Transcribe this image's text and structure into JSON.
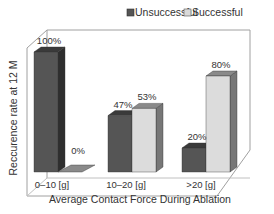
{
  "chart_data": {
    "type": "bar",
    "style": "3d-clustered",
    "title": "",
    "xlabel": "Average Contact Force During Ablation",
    "ylabel": "Reccurence rate at 12 M",
    "categories": [
      "0–10 [g]",
      "10–20 [g]",
      ">20 [g]"
    ],
    "series": [
      {
        "name": "Unsuccessful",
        "values": [
          100,
          47,
          20
        ],
        "labels": [
          "100%",
          "47%",
          "20%"
        ],
        "color": "#555555"
      },
      {
        "name": "Successful",
        "values": [
          0,
          53,
          80
        ],
        "labels": [
          "0%",
          "53%",
          "80%"
        ],
        "color": "#d9d9d9"
      }
    ],
    "ylim": [
      0,
      100
    ],
    "grid": false,
    "legend_position": "top",
    "value_unit": "%"
  },
  "legend": {
    "items": [
      {
        "label": "Unsuccessful",
        "color": "#555555"
      },
      {
        "label": "Successful",
        "color": "#d9d9d9"
      }
    ]
  },
  "colors": {
    "unsuccessful_front": "#555555",
    "unsuccessful_top": "#3a3a3a",
    "unsuccessful_side": "#2e2e2e",
    "successful_front": "#dcdcdc",
    "successful_top": "#8a8a8a",
    "successful_side": "#777777",
    "frame": "#9a9a9a"
  }
}
